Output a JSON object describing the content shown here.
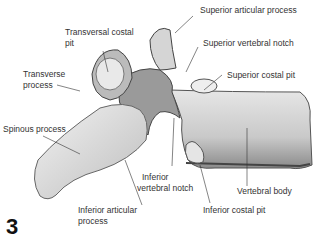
{
  "diagram": {
    "figure_number": "3",
    "labels": {
      "superior_articular_process": "Superior articular process",
      "transversal_costal_pit_1": "Transversal costal",
      "transversal_costal_pit_2": "pit",
      "superior_vertebral_notch": "Superior vertebral notch",
      "transverse_process_1": "Transverse",
      "transverse_process_2": "process",
      "superior_costal_pit": "Superior costal pit",
      "spinous_process": "Spinous process",
      "inferior_vertebral_notch_1": "Inferior",
      "inferior_vertebral_notch_2": "vertebral notch",
      "vertebral_body": "Vertebral body",
      "inferior_articular_process_1": "Inferior articular",
      "inferior_articular_process_2": "process",
      "inferior_costal_pit": "Inferior costal pit"
    }
  }
}
